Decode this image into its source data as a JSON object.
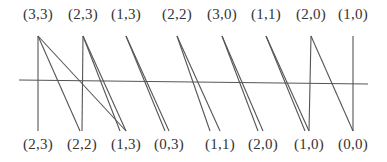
{
  "diagram": {
    "line_color": "#555555",
    "axis": {
      "x1": 19,
      "y1": 80,
      "x2": 368,
      "y2": 84
    },
    "top_y": 36,
    "bottom_y": 131,
    "top_nodes": [
      {
        "label": "(3,3)",
        "x": 38
      },
      {
        "label": "(2,3)",
        "x": 83
      },
      {
        "label": "(1,3)",
        "x": 126
      },
      {
        "label": "(2,2)",
        "x": 177
      },
      {
        "label": "(3,0)",
        "x": 222
      },
      {
        "label": "(1,1)",
        "x": 266
      },
      {
        "label": "(2,0)",
        "x": 311
      },
      {
        "label": "(1,0)",
        "x": 353
      }
    ],
    "bottom_nodes": [
      {
        "label": "(2,3)",
        "x": 38
      },
      {
        "label": "(2,2)",
        "x": 82
      },
      {
        "label": "(1,3)",
        "x": 126
      },
      {
        "label": "(0,3)",
        "x": 169
      },
      {
        "label": "(1,1)",
        "x": 220
      },
      {
        "label": "(2,0)",
        "x": 263
      },
      {
        "label": "(1,0)",
        "x": 309
      },
      {
        "label": "(0,0)",
        "x": 353
      }
    ],
    "edges": [
      {
        "from_x": 38,
        "to_x": 38
      },
      {
        "from_x": 38,
        "to_x": 80
      },
      {
        "from_x": 38,
        "to_x": 126
      },
      {
        "from_x": 83,
        "to_x": 82
      },
      {
        "from_x": 83,
        "to_x": 120
      },
      {
        "from_x": 83,
        "to_x": 126
      },
      {
        "from_x": 126,
        "to_x": 165
      },
      {
        "from_x": 126,
        "to_x": 169
      },
      {
        "from_x": 177,
        "to_x": 210
      },
      {
        "from_x": 177,
        "to_x": 220
      },
      {
        "from_x": 222,
        "to_x": 258
      },
      {
        "from_x": 222,
        "to_x": 263
      },
      {
        "from_x": 266,
        "to_x": 305
      },
      {
        "from_x": 266,
        "to_x": 309
      },
      {
        "from_x": 311,
        "to_x": 309
      },
      {
        "from_x": 311,
        "to_x": 353
      },
      {
        "from_x": 353,
        "to_x": 353
      }
    ]
  }
}
